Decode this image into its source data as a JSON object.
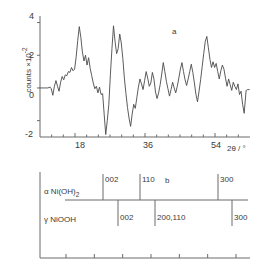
{
  "figure": {
    "panel_a_label": "a",
    "panel_b_label": "b"
  },
  "chart_data": {
    "type": "line",
    "title": "",
    "subtitle": "",
    "xlabel": "2θ / °",
    "ylabel": "counts ×10⁻²",
    "ylabel_main": "counts ×10",
    "ylabel_exp": "-2",
    "xlim": [
      9,
      63
    ],
    "ylim": [
      -3,
      4.4
    ],
    "grid": false,
    "legend_position": "none",
    "xticks_major": [
      18,
      36,
      54
    ],
    "xticks_major_labels": [
      "18",
      "36",
      "54"
    ],
    "xticks_minor": [
      12,
      15,
      21,
      24,
      27,
      30,
      33,
      39,
      42,
      45,
      48,
      51,
      57,
      60
    ],
    "yticks": [
      4,
      2,
      0,
      -2
    ],
    "ytick_labels": [
      "4",
      "2",
      "0",
      "-2"
    ],
    "series": [
      {
        "name": "diffractogram",
        "x": [
          9.0,
          10.1,
          11.0,
          11.6,
          11.9,
          12.3,
          12.7,
          13.1,
          13.5,
          13.9,
          14.3,
          14.7,
          15.1,
          15.5,
          15.9,
          16.3,
          16.7,
          17.1,
          17.5,
          17.9,
          18.3,
          18.7,
          19.1,
          19.5,
          19.9,
          20.3,
          20.7,
          21.1,
          21.5,
          21.9,
          22.3,
          22.7,
          23.1,
          23.5,
          23.9,
          24.3,
          24.7,
          25.1,
          25.5,
          25.9,
          26.3,
          26.7,
          27.1,
          27.5,
          27.9,
          28.3,
          28.7,
          29.1,
          29.5,
          29.9,
          30.3,
          30.7,
          31.1,
          31.5,
          31.9,
          32.3,
          32.7,
          33.1,
          33.5,
          33.9,
          34.3,
          34.7,
          35.1,
          35.5,
          35.9,
          36.3,
          36.7,
          37.1,
          37.5,
          37.9,
          38.3,
          38.7,
          39.1,
          39.5,
          39.9,
          40.3,
          40.7,
          41.1,
          41.5,
          41.9,
          42.3,
          42.7,
          43.1,
          43.5,
          43.9,
          44.3,
          44.7,
          45.1,
          45.5,
          45.9,
          46.3,
          46.7,
          47.1,
          47.5,
          47.9,
          48.3,
          48.7,
          49.1,
          49.5,
          49.9,
          50.3,
          50.7,
          51.1,
          51.5,
          51.9,
          52.3,
          52.7,
          53.1,
          53.5,
          53.9,
          54.3,
          54.7,
          55.1,
          55.5,
          55.9,
          56.3,
          56.7,
          57.1,
          57.5,
          57.9,
          58.3,
          58.7,
          59.1,
          59.5,
          59.9,
          60.3,
          60.7,
          61.1,
          61.5,
          62.0,
          62.4,
          62.8
        ],
        "y": [
          0.0,
          0.0,
          0.0,
          0.05,
          -0.05,
          -0.45,
          0.1,
          0.45,
          0.1,
          -0.2,
          0.35,
          0.7,
          0.5,
          0.8,
          0.75,
          1.0,
          0.95,
          1.25,
          1.05,
          1.15,
          1.9,
          2.9,
          3.75,
          3.1,
          2.2,
          1.65,
          2.0,
          1.4,
          1.85,
          1.2,
          0.75,
          0.3,
          -0.05,
          0.1,
          -0.3,
          0.05,
          -0.4,
          -0.35,
          -1.6,
          -2.85,
          -2.0,
          -1.0,
          0.8,
          2.4,
          3.8,
          2.85,
          2.1,
          2.4,
          3.3,
          2.75,
          1.8,
          0.6,
          -0.35,
          -1.2,
          -1.85,
          -2.35,
          -1.6,
          -1.0,
          -1.25,
          -0.6,
          0.05,
          0.55,
          0.25,
          -0.1,
          0.45,
          1.0,
          0.6,
          0.1,
          0.3,
          0.95,
          0.55,
          -0.25,
          -0.65,
          -0.3,
          0.2,
          0.85,
          1.55,
          1.0,
          0.4,
          -0.05,
          -0.5,
          -0.1,
          0.35,
          0.0,
          -0.3,
          0.1,
          0.6,
          1.15,
          1.55,
          1.0,
          0.5,
          0.15,
          0.55,
          1.0,
          1.45,
          0.95,
          0.3,
          -0.4,
          -0.85,
          -0.2,
          0.5,
          1.3,
          2.1,
          2.85,
          3.15,
          2.45,
          1.75,
          1.25,
          1.6,
          1.25,
          1.5,
          1.0,
          0.55,
          1.05,
          1.4,
          1.15,
          0.6,
          0.1,
          0.55,
          0.2,
          -0.15,
          0.35,
          0.1,
          -0.1,
          0.25,
          -0.4,
          -0.2,
          -1.0,
          -1.55,
          -0.15,
          -0.1,
          -0.1
        ]
      }
    ]
  },
  "phase_panel": {
    "phases": [
      {
        "symbol": "α",
        "name": "Ni(OH)",
        "subscript": "2",
        "label_full": "α Ni(OH)₂",
        "peaks": [
          {
            "hkl": "002",
            "x_px": 103
          },
          {
            "hkl": "110",
            "x_px": 140
          },
          {
            "hkl": "300",
            "x_px": 218
          }
        ]
      },
      {
        "symbol": "γ",
        "name": "NiOOH",
        "subscript": "",
        "label_full": "γ NiOOH",
        "peaks": [
          {
            "hkl": "002",
            "x_px": 118
          },
          {
            "hkl": "200,110",
            "x_px": 155
          },
          {
            "hkl": "300",
            "x_px": 232
          }
        ]
      }
    ],
    "axis_ticks_count": 7
  },
  "colors": {
    "line": "#4a4a4a",
    "axis": "#6b6b6b",
    "text": "#3a3a3a",
    "background": "#ffffff"
  }
}
